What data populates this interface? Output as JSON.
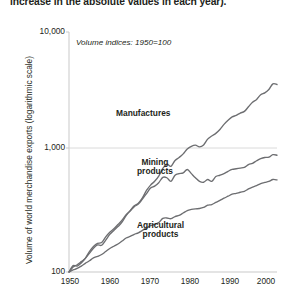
{
  "caption": {
    "text": "increase in the absolute values in each year)."
  },
  "chart_data": {
    "type": "line",
    "title": "",
    "annotation": "Volume indices: 1950=100",
    "xlabel": "",
    "ylabel": "Volume of world merchandise exports (logarithmic scale)",
    "scale": "log",
    "grid": true,
    "legend_position": "inline-labels",
    "xlim": [
      1950,
      2001
    ],
    "ylim": [
      100,
      10000
    ],
    "xticks": [
      1950,
      1960,
      1970,
      1980,
      1990,
      2000
    ],
    "xtick_labels": [
      "1950",
      "1960",
      "1970",
      "1980",
      "1990",
      "2000"
    ],
    "yticks": [
      100,
      1000,
      10000
    ],
    "ytick_labels": [
      "100",
      "1,000",
      "10,000"
    ],
    "line_color": "#6d6e71",
    "grid_color": "#d9d9d9",
    "axis_color": "#c7c7c7",
    "series": [
      {
        "name": "Manufactures",
        "color": "#6d6e71",
        "x": [
          1950,
          1951,
          1952,
          1953,
          1954,
          1955,
          1956,
          1957,
          1958,
          1959,
          1960,
          1961,
          1962,
          1963,
          1964,
          1965,
          1966,
          1967,
          1968,
          1969,
          1970,
          1971,
          1972,
          1973,
          1974,
          1975,
          1976,
          1977,
          1978,
          1979,
          1980,
          1981,
          1982,
          1983,
          1984,
          1985,
          1986,
          1987,
          1988,
          1989,
          1990,
          1991,
          1992,
          1993,
          1994,
          1995,
          1996,
          1997,
          1998,
          1999,
          2000,
          2001
        ],
        "values": [
          100,
          113,
          112,
          119,
          130,
          143,
          158,
          168,
          167,
          184,
          206,
          222,
          239,
          260,
          295,
          325,
          356,
          375,
          415,
          478,
          530,
          570,
          630,
          730,
          790,
          760,
          850,
          900,
          965,
          1060,
          1115,
          1140,
          1105,
          1145,
          1280,
          1360,
          1430,
          1540,
          1700,
          1840,
          1960,
          2020,
          2110,
          2180,
          2380,
          2600,
          2740,
          3000,
          3110,
          3320,
          3700,
          3650
        ]
      },
      {
        "name": "Mining products",
        "color": "#6d6e71",
        "x": [
          1950,
          1951,
          1952,
          1953,
          1954,
          1955,
          1956,
          1957,
          1958,
          1959,
          1960,
          1961,
          1962,
          1963,
          1964,
          1965,
          1966,
          1967,
          1968,
          1969,
          1970,
          1971,
          1972,
          1973,
          1974,
          1975,
          1976,
          1977,
          1978,
          1979,
          1980,
          1981,
          1982,
          1983,
          1984,
          1985,
          1986,
          1987,
          1988,
          1989,
          1990,
          1991,
          1992,
          1993,
          1994,
          1995,
          1996,
          1997,
          1998,
          1999,
          2000,
          2001
        ],
        "values": [
          100,
          110,
          115,
          122,
          130,
          148,
          163,
          173,
          176,
          196,
          214,
          229,
          249,
          270,
          300,
          322,
          350,
          368,
          405,
          450,
          500,
          520,
          555,
          615,
          610,
          570,
          640,
          660,
          670,
          715,
          660,
          610,
          570,
          560,
          590,
          570,
          625,
          640,
          660,
          690,
          715,
          725,
          735,
          745,
          785,
          805,
          845,
          880,
          900,
          905,
          950,
          940
        ]
      },
      {
        "name": "Agricultural products",
        "color": "#6d6e71",
        "x": [
          1950,
          1951,
          1952,
          1953,
          1954,
          1955,
          1956,
          1957,
          1958,
          1959,
          1960,
          1961,
          1962,
          1963,
          1964,
          1965,
          1966,
          1967,
          1968,
          1969,
          1970,
          1971,
          1972,
          1973,
          1974,
          1975,
          1976,
          1977,
          1978,
          1979,
          1980,
          1981,
          1982,
          1983,
          1984,
          1985,
          1986,
          1987,
          1988,
          1989,
          1990,
          1991,
          1992,
          1993,
          1994,
          1995,
          1996,
          1997,
          1998,
          1999,
          2000,
          2001
        ],
        "values": [
          100,
          104,
          107,
          112,
          118,
          124,
          131,
          135,
          140,
          148,
          157,
          164,
          171,
          181,
          192,
          198,
          206,
          212,
          222,
          232,
          243,
          250,
          258,
          280,
          282,
          278,
          290,
          296,
          310,
          325,
          332,
          336,
          338,
          345,
          360,
          365,
          380,
          395,
          412,
          428,
          445,
          452,
          462,
          470,
          492,
          510,
          525,
          545,
          558,
          568,
          590,
          585
        ]
      }
    ]
  }
}
